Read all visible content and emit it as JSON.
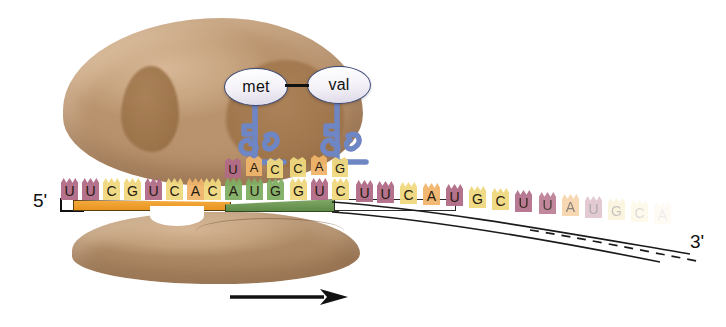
{
  "figure": {
    "background_color": "#ffffff"
  },
  "labels": {
    "five_prime": "5'",
    "three_prime": "3'"
  },
  "ribosome": {
    "large_subunit_name": "large-ribosomal-subunit",
    "small_subunit_name": "small-ribosomal-subunit",
    "color": "#c2a07c",
    "shadow_color": "#9b7147"
  },
  "amino_acids": [
    {
      "name": "met",
      "label": "met",
      "position": "P-site"
    },
    {
      "name": "val",
      "label": "val",
      "position": "A-site"
    }
  ],
  "peptide_bond": {
    "visible": true,
    "color": "#111111"
  },
  "trnas": [
    {
      "name": "trna-met",
      "anticodon": [
        "U",
        "A",
        "C"
      ],
      "carries": "met",
      "color": "#6f86c4"
    },
    {
      "name": "trna-val",
      "anticodon": [
        "C",
        "A",
        "G"
      ],
      "carries": "val",
      "color": "#6f86c4"
    }
  ],
  "mrna": {
    "strand_label": "mRNA",
    "direction_arrow": "ribosome movement 5' to 3'",
    "bases": [
      {
        "letter": "U",
        "color": "#b06a86",
        "x": 61,
        "y": 178,
        "opacity": 1
      },
      {
        "letter": "U",
        "color": "#b06a86",
        "x": 82,
        "y": 178,
        "opacity": 1
      },
      {
        "letter": "C",
        "color": "#efd87e",
        "x": 103,
        "y": 178,
        "opacity": 1
      },
      {
        "letter": "G",
        "color": "#efd87e",
        "x": 124,
        "y": 178,
        "opacity": 1
      },
      {
        "letter": "U",
        "color": "#b06a86",
        "x": 145,
        "y": 178,
        "opacity": 1
      },
      {
        "letter": "C",
        "color": "#efd87e",
        "x": 166,
        "y": 178,
        "opacity": 1
      },
      {
        "letter": "A",
        "color": "#efb46a",
        "x": 187,
        "y": 178,
        "opacity": 1
      },
      {
        "letter": "C",
        "color": "#efd87e",
        "x": 204,
        "y": 178,
        "opacity": 1
      },
      {
        "letter": "A",
        "color": "#7fae63",
        "x": 225,
        "y": 178,
        "opacity": 1
      },
      {
        "letter": "U",
        "color": "#7fae63",
        "x": 246,
        "y": 178,
        "opacity": 1
      },
      {
        "letter": "G",
        "color": "#7fae63",
        "x": 267,
        "y": 178,
        "opacity": 1
      },
      {
        "letter": "G",
        "color": "#efd87e",
        "x": 290,
        "y": 178,
        "opacity": 1
      },
      {
        "letter": "U",
        "color": "#b06a86",
        "x": 311,
        "y": 178,
        "opacity": 1
      },
      {
        "letter": "C",
        "color": "#efd87e",
        "x": 332,
        "y": 178,
        "opacity": 1
      },
      {
        "letter": "U",
        "color": "#b06a86",
        "x": 356,
        "y": 180,
        "opacity": 1
      },
      {
        "letter": "U",
        "color": "#b06a86",
        "x": 377,
        "y": 181,
        "opacity": 1
      },
      {
        "letter": "C",
        "color": "#efd87e",
        "x": 400,
        "y": 182,
        "opacity": 1
      },
      {
        "letter": "A",
        "color": "#efb46a",
        "x": 423,
        "y": 183,
        "opacity": 1
      },
      {
        "letter": "U",
        "color": "#b06a86",
        "x": 446,
        "y": 184,
        "opacity": 1
      },
      {
        "letter": "G",
        "color": "#efd87e",
        "x": 469,
        "y": 186,
        "opacity": 1
      },
      {
        "letter": "C",
        "color": "#efd87e",
        "x": 492,
        "y": 188,
        "opacity": 1
      },
      {
        "letter": "U",
        "color": "#b06a86",
        "x": 515,
        "y": 190,
        "opacity": 0.95
      },
      {
        "letter": "U",
        "color": "#b06a86",
        "x": 539,
        "y": 192,
        "opacity": 0.85
      },
      {
        "letter": "A",
        "color": "#efb46a",
        "x": 562,
        "y": 194,
        "opacity": 0.55
      },
      {
        "letter": "U",
        "color": "#b06a86",
        "x": 585,
        "y": 196,
        "opacity": 0.38
      },
      {
        "letter": "G",
        "color": "#efd87e",
        "x": 608,
        "y": 198,
        "opacity": 0.26
      },
      {
        "letter": "C",
        "color": "#efd87e",
        "x": 631,
        "y": 200,
        "opacity": 0.16
      },
      {
        "letter": "A",
        "color": "#efb46a",
        "x": 654,
        "y": 202,
        "opacity": 0.08
      }
    ],
    "segments": [
      {
        "name": "upstream-orange-bar",
        "color": "#e8951f"
      },
      {
        "name": "start-codon-green-bar",
        "color": "#5f8a47"
      },
      {
        "name": "downstream-white-bar",
        "color": "#ffffff"
      }
    ]
  },
  "codons": {
    "p_site": [
      "A",
      "U",
      "G"
    ],
    "a_site": [
      "G",
      "U",
      "C"
    ]
  },
  "arrow": {
    "name": "direction-arrow",
    "color": "#111111",
    "direction": "right"
  }
}
